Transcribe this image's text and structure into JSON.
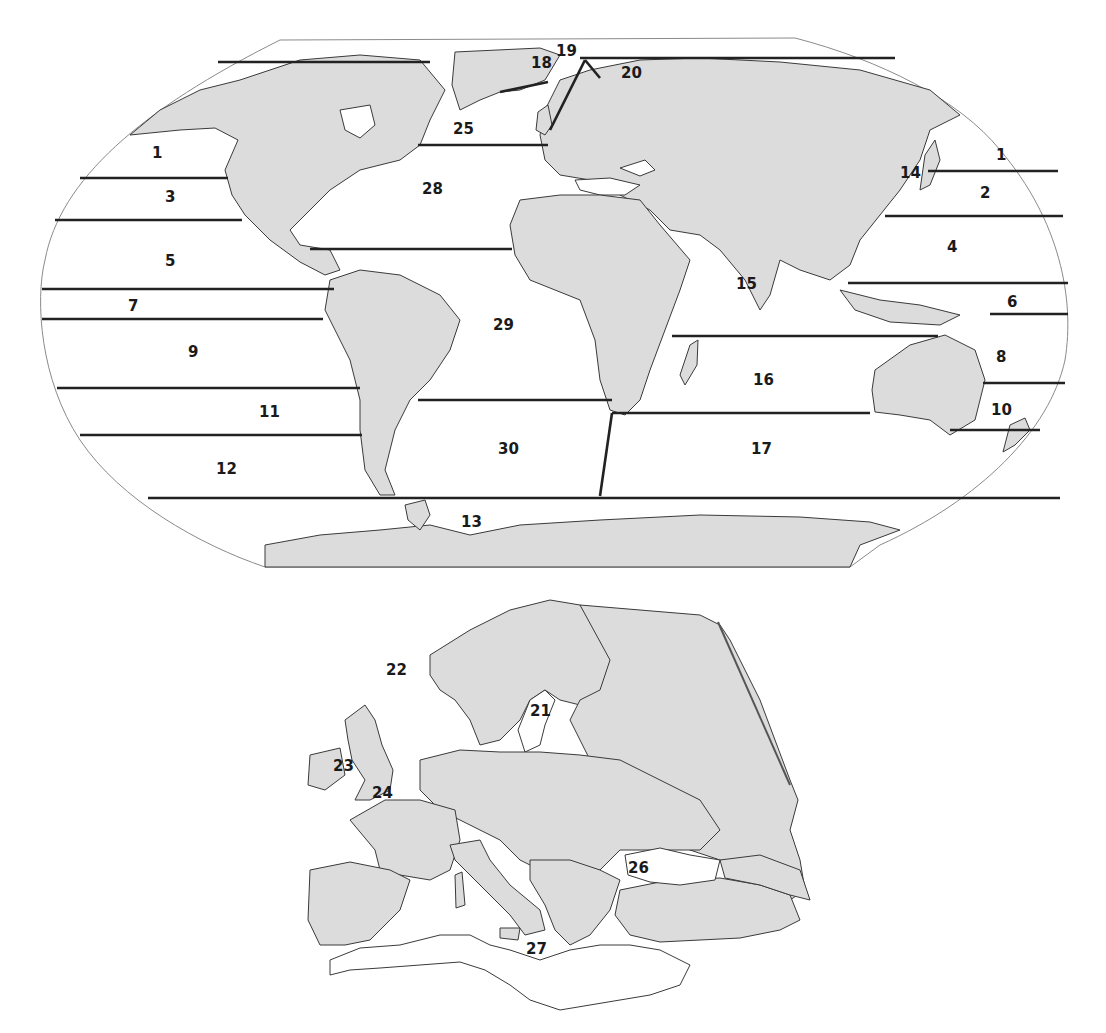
{
  "figure": {
    "title": ""
  },
  "world_map": {
    "zones": [
      {
        "id": "1",
        "label": "1",
        "x": 158,
        "y": 153
      },
      {
        "id": "1b",
        "label": "1",
        "x": 1000,
        "y": 158
      },
      {
        "id": "2",
        "label": "2",
        "x": 985,
        "y": 196
      },
      {
        "id": "3",
        "label": "3",
        "x": 170,
        "y": 200
      },
      {
        "id": "4",
        "label": "4",
        "x": 952,
        "y": 250
      },
      {
        "id": "5",
        "label": "5",
        "x": 170,
        "y": 265
      },
      {
        "id": "6",
        "label": "6",
        "x": 1012,
        "y": 305
      },
      {
        "id": "7",
        "label": "7",
        "x": 133,
        "y": 310
      },
      {
        "id": "8",
        "label": "8",
        "x": 1002,
        "y": 360
      },
      {
        "id": "9",
        "label": "9",
        "x": 194,
        "y": 357
      },
      {
        "id": "10",
        "label": "10",
        "x": 1000,
        "y": 414
      },
      {
        "id": "11",
        "label": "11",
        "x": 268,
        "y": 418
      },
      {
        "id": "12",
        "label": "12",
        "x": 225,
        "y": 475
      },
      {
        "id": "13",
        "label": "13",
        "x": 470,
        "y": 527
      },
      {
        "id": "14",
        "label": "14",
        "x": 909,
        "y": 177
      },
      {
        "id": "15",
        "label": "15",
        "x": 745,
        "y": 289
      },
      {
        "id": "16",
        "label": "16",
        "x": 762,
        "y": 385
      },
      {
        "id": "17",
        "label": "17",
        "x": 760,
        "y": 454
      },
      {
        "id": "18",
        "label": "18",
        "x": 540,
        "y": 68
      },
      {
        "id": "19",
        "label": "19",
        "x": 566,
        "y": 56
      },
      {
        "id": "20",
        "label": "20",
        "x": 630,
        "y": 78
      },
      {
        "id": "25",
        "label": "25",
        "x": 463,
        "y": 134
      },
      {
        "id": "28",
        "label": "28",
        "x": 432,
        "y": 194
      },
      {
        "id": "29",
        "label": "29",
        "x": 503,
        "y": 330
      },
      {
        "id": "30",
        "label": "30",
        "x": 508,
        "y": 454
      }
    ]
  },
  "europe_map": {
    "zones": [
      {
        "id": "21",
        "label": "21",
        "x": 543,
        "y": 713
      },
      {
        "id": "22",
        "label": "22",
        "x": 398,
        "y": 673
      },
      {
        "id": "23",
        "label": "23",
        "x": 345,
        "y": 768
      },
      {
        "id": "24",
        "label": "24",
        "x": 383,
        "y": 795
      },
      {
        "id": "26",
        "label": "26",
        "x": 641,
        "y": 871
      },
      {
        "id": "27",
        "label": "27",
        "x": 538,
        "y": 952
      }
    ]
  },
  "colors": {
    "land": "#dcdcdc",
    "water": "#ffffff",
    "zone_line": "#222222",
    "coast": "#3a3a3a"
  }
}
